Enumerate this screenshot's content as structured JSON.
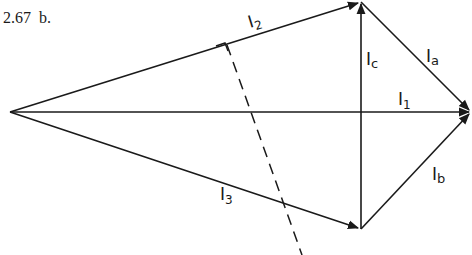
{
  "figure": {
    "number": "2.67",
    "part": "b."
  },
  "colors": {
    "stroke": "#1a1a1a",
    "background": "#ffffff"
  },
  "vectors": [
    {
      "id": "I2",
      "label": "I",
      "sub": "2",
      "from": [
        10,
        112
      ],
      "to": [
        361,
        2
      ]
    },
    {
      "id": "I1",
      "label": "I",
      "sub": "1",
      "from": [
        10,
        112
      ],
      "to": [
        471,
        112
      ]
    },
    {
      "id": "I3",
      "label": "I",
      "sub": "3",
      "from": [
        10,
        112
      ],
      "to": [
        361,
        229
      ]
    },
    {
      "id": "Ic",
      "label": "I",
      "sub": "c",
      "from": [
        361,
        229
      ],
      "to": [
        361,
        2
      ]
    },
    {
      "id": "Ia",
      "label": "I",
      "sub": "a",
      "from": [
        361,
        2
      ],
      "to": [
        471,
        112
      ]
    },
    {
      "id": "Ib",
      "label": "I",
      "sub": "b",
      "from": [
        361,
        229
      ],
      "to": [
        471,
        112
      ]
    }
  ],
  "labels": {
    "I2": {
      "main": "I",
      "sub": "2"
    },
    "I1": {
      "main": "I",
      "sub": "1"
    },
    "I3": {
      "main": "I",
      "sub": "3"
    },
    "Ic": {
      "main": "I",
      "sub": "c"
    },
    "Ia": {
      "main": "I",
      "sub": "a"
    },
    "Ib": {
      "main": "I",
      "sub": "b"
    }
  }
}
